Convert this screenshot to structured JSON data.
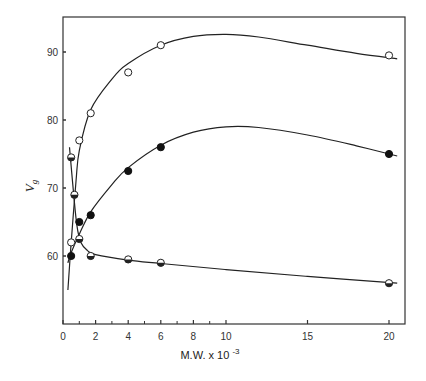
{
  "chart_data": {
    "type": "scatter",
    "title": "",
    "xlabel": "M.W. x 10",
    "xlabel_exponent": "-3",
    "ylabel": "V",
    "ylabel_subscript": "g",
    "xlim": [
      0,
      21
    ],
    "ylim": [
      50,
      95
    ],
    "x_ticks_major": [
      0,
      2,
      4,
      6,
      8,
      10,
      15,
      20
    ],
    "x_ticks_minor": [
      1,
      3,
      5,
      7,
      9
    ],
    "y_ticks": [
      60,
      70,
      80,
      90
    ],
    "grid": false,
    "legend": null,
    "series": [
      {
        "name": "open-circles",
        "marker": "open",
        "points": [
          [
            0.5,
            62
          ],
          [
            1.0,
            77
          ],
          [
            1.7,
            81
          ],
          [
            4.0,
            87
          ],
          [
            6.0,
            91
          ],
          [
            20.0,
            89.5
          ]
        ],
        "curve": [
          [
            0.3,
            55
          ],
          [
            0.5,
            62
          ],
          [
            0.8,
            71
          ],
          [
            1.0,
            75.5
          ],
          [
            1.7,
            81.5
          ],
          [
            3,
            86
          ],
          [
            4,
            88.3
          ],
          [
            6,
            91
          ],
          [
            8,
            92.3
          ],
          [
            10,
            92.6
          ],
          [
            12,
            92.2
          ],
          [
            15,
            91
          ],
          [
            18,
            89.8
          ],
          [
            20.5,
            89
          ]
        ]
      },
      {
        "name": "filled-circles",
        "marker": "filled",
        "points": [
          [
            0.5,
            60
          ],
          [
            1.0,
            65
          ],
          [
            1.7,
            66
          ],
          [
            4.0,
            72.5
          ],
          [
            6.0,
            76
          ],
          [
            20.0,
            75
          ]
        ],
        "curve": [
          [
            0.3,
            59
          ],
          [
            0.5,
            60.5
          ],
          [
            1.0,
            63.2
          ],
          [
            1.7,
            66.5
          ],
          [
            3,
            70.5
          ],
          [
            4,
            73
          ],
          [
            6,
            76.3
          ],
          [
            8,
            78.2
          ],
          [
            10,
            79
          ],
          [
            12,
            78.9
          ],
          [
            15,
            77.8
          ],
          [
            18,
            76.2
          ],
          [
            20.5,
            74.7
          ]
        ]
      },
      {
        "name": "half-filled-circles",
        "marker": "half",
        "points": [
          [
            0.5,
            74.5
          ],
          [
            0.7,
            69
          ],
          [
            1.0,
            62.5
          ],
          [
            1.7,
            60
          ],
          [
            4.0,
            59.5
          ],
          [
            6.0,
            59
          ],
          [
            20.0,
            56
          ]
        ],
        "curve": [
          [
            0.4,
            76
          ],
          [
            0.6,
            70.5
          ],
          [
            0.85,
            64.5
          ],
          [
            1.1,
            62
          ],
          [
            1.5,
            60.8
          ],
          [
            2,
            60.2
          ],
          [
            4,
            59.4
          ],
          [
            6,
            58.9
          ],
          [
            10,
            58
          ],
          [
            15,
            57
          ],
          [
            20.5,
            56
          ]
        ]
      }
    ]
  }
}
